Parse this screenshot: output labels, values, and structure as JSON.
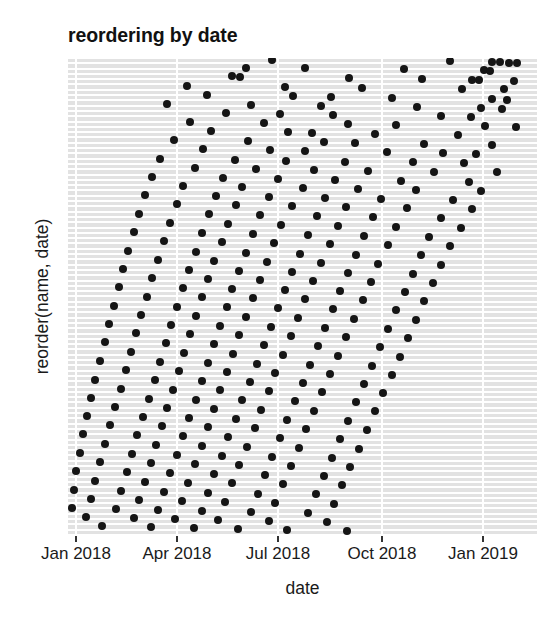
{
  "chart_data": {
    "type": "scatter",
    "title": "reordering by date",
    "xlabel": "date",
    "ylabel": "reorder(name, date)",
    "grid": "horizontal-row-bands-with-vertical-white-gridlines",
    "legend": null,
    "xlim": [
      "2017-12-05",
      "2019-02-20"
    ],
    "x_tick_labels": [
      "Jan 2018",
      "Apr 2018",
      "Jul 2018",
      "Oct 2018",
      "Jan 2019"
    ],
    "x_tick_values": [
      "2018-01-01",
      "2018-04-01",
      "2018-07-01",
      "2018-10-01",
      "2019-01-01"
    ],
    "x_tick_pixels": [
      76,
      177,
      278,
      382,
      483
    ],
    "y_tick_labels": [],
    "y_axis_note": "categorical: names reordered by date; ~90 unlabelled category rows, latest dates at top",
    "n_rows": 90,
    "n_points": 268,
    "point_color": "#151515",
    "point_radius_px": 4,
    "panel_background": "#ffffff",
    "row_band_color": "#e2e2e2",
    "gridline_color": "#ffffff",
    "points_xy_fraction": [
      [
        0.435,
        0.004
      ],
      [
        0.815,
        0.006
      ],
      [
        0.905,
        0.008
      ],
      [
        0.922,
        0.009
      ],
      [
        0.941,
        0.01
      ],
      [
        0.958,
        0.011
      ],
      [
        0.38,
        0.02
      ],
      [
        0.505,
        0.022
      ],
      [
        0.717,
        0.024
      ],
      [
        0.888,
        0.026
      ],
      [
        0.9,
        0.028
      ],
      [
        0.35,
        0.038
      ],
      [
        0.366,
        0.04
      ],
      [
        0.6,
        0.042
      ],
      [
        0.755,
        0.044
      ],
      [
        0.862,
        0.046
      ],
      [
        0.876,
        0.047
      ],
      [
        0.95,
        0.048
      ],
      [
        0.253,
        0.058
      ],
      [
        0.462,
        0.06
      ],
      [
        0.627,
        0.062
      ],
      [
        0.84,
        0.064
      ],
      [
        0.93,
        0.066
      ],
      [
        0.297,
        0.077
      ],
      [
        0.48,
        0.079
      ],
      [
        0.56,
        0.081
      ],
      [
        0.69,
        0.083
      ],
      [
        0.905,
        0.085
      ],
      [
        0.935,
        0.087
      ],
      [
        0.212,
        0.096
      ],
      [
        0.39,
        0.098
      ],
      [
        0.54,
        0.1
      ],
      [
        0.745,
        0.102
      ],
      [
        0.88,
        0.104
      ],
      [
        0.925,
        0.106
      ],
      [
        0.337,
        0.115
      ],
      [
        0.452,
        0.117
      ],
      [
        0.566,
        0.119
      ],
      [
        0.795,
        0.121
      ],
      [
        0.86,
        0.123
      ],
      [
        0.26,
        0.134
      ],
      [
        0.418,
        0.136
      ],
      [
        0.598,
        0.138
      ],
      [
        0.7,
        0.14
      ],
      [
        0.89,
        0.142
      ],
      [
        0.955,
        0.144
      ],
      [
        0.305,
        0.153
      ],
      [
        0.47,
        0.155
      ],
      [
        0.52,
        0.157
      ],
      [
        0.655,
        0.159
      ],
      [
        0.832,
        0.161
      ],
      [
        0.225,
        0.172
      ],
      [
        0.383,
        0.174
      ],
      [
        0.545,
        0.176
      ],
      [
        0.612,
        0.178
      ],
      [
        0.76,
        0.18
      ],
      [
        0.905,
        0.182
      ],
      [
        0.288,
        0.191
      ],
      [
        0.43,
        0.193
      ],
      [
        0.505,
        0.195
      ],
      [
        0.68,
        0.197
      ],
      [
        0.8,
        0.199
      ],
      [
        0.87,
        0.201
      ],
      [
        0.196,
        0.211
      ],
      [
        0.355,
        0.213
      ],
      [
        0.465,
        0.215
      ],
      [
        0.59,
        0.217
      ],
      [
        0.735,
        0.219
      ],
      [
        0.845,
        0.221
      ],
      [
        0.27,
        0.23
      ],
      [
        0.4,
        0.232
      ],
      [
        0.525,
        0.234
      ],
      [
        0.64,
        0.236
      ],
      [
        0.78,
        0.238
      ],
      [
        0.915,
        0.24
      ],
      [
        0.18,
        0.249
      ],
      [
        0.33,
        0.251
      ],
      [
        0.447,
        0.253
      ],
      [
        0.57,
        0.255
      ],
      [
        0.71,
        0.257
      ],
      [
        0.855,
        0.259
      ],
      [
        0.245,
        0.268
      ],
      [
        0.372,
        0.27
      ],
      [
        0.5,
        0.272
      ],
      [
        0.618,
        0.274
      ],
      [
        0.742,
        0.276
      ],
      [
        0.88,
        0.278
      ],
      [
        0.165,
        0.288
      ],
      [
        0.315,
        0.29
      ],
      [
        0.428,
        0.292
      ],
      [
        0.548,
        0.294
      ],
      [
        0.668,
        0.296
      ],
      [
        0.82,
        0.298
      ],
      [
        0.232,
        0.307
      ],
      [
        0.358,
        0.309
      ],
      [
        0.478,
        0.311
      ],
      [
        0.592,
        0.313
      ],
      [
        0.722,
        0.315
      ],
      [
        0.862,
        0.317
      ],
      [
        0.152,
        0.326
      ],
      [
        0.3,
        0.328
      ],
      [
        0.41,
        0.33
      ],
      [
        0.53,
        0.332
      ],
      [
        0.65,
        0.334
      ],
      [
        0.795,
        0.336
      ],
      [
        0.218,
        0.346
      ],
      [
        0.342,
        0.348
      ],
      [
        0.455,
        0.35
      ],
      [
        0.575,
        0.352
      ],
      [
        0.7,
        0.354
      ],
      [
        0.838,
        0.356
      ],
      [
        0.14,
        0.365
      ],
      [
        0.285,
        0.367
      ],
      [
        0.395,
        0.369
      ],
      [
        0.512,
        0.371
      ],
      [
        0.632,
        0.373
      ],
      [
        0.77,
        0.375
      ],
      [
        0.205,
        0.384
      ],
      [
        0.328,
        0.386
      ],
      [
        0.44,
        0.388
      ],
      [
        0.558,
        0.39
      ],
      [
        0.682,
        0.392
      ],
      [
        0.815,
        0.394
      ],
      [
        0.128,
        0.404
      ],
      [
        0.272,
        0.406
      ],
      [
        0.38,
        0.408
      ],
      [
        0.495,
        0.41
      ],
      [
        0.615,
        0.412
      ],
      [
        0.752,
        0.414
      ],
      [
        0.192,
        0.423
      ],
      [
        0.312,
        0.425
      ],
      [
        0.425,
        0.427
      ],
      [
        0.54,
        0.429
      ],
      [
        0.662,
        0.431
      ],
      [
        0.795,
        0.433
      ],
      [
        0.118,
        0.442
      ],
      [
        0.258,
        0.444
      ],
      [
        0.365,
        0.446
      ],
      [
        0.478,
        0.448
      ],
      [
        0.598,
        0.45
      ],
      [
        0.735,
        0.452
      ],
      [
        0.18,
        0.461
      ],
      [
        0.298,
        0.463
      ],
      [
        0.41,
        0.465
      ],
      [
        0.522,
        0.467
      ],
      [
        0.645,
        0.469
      ],
      [
        0.778,
        0.471
      ],
      [
        0.108,
        0.481
      ],
      [
        0.245,
        0.483
      ],
      [
        0.35,
        0.485
      ],
      [
        0.462,
        0.487
      ],
      [
        0.58,
        0.489
      ],
      [
        0.718,
        0.491
      ],
      [
        0.168,
        0.5
      ],
      [
        0.285,
        0.502
      ],
      [
        0.395,
        0.504
      ],
      [
        0.505,
        0.506
      ],
      [
        0.628,
        0.508
      ],
      [
        0.76,
        0.51
      ],
      [
        0.098,
        0.519
      ],
      [
        0.232,
        0.521
      ],
      [
        0.338,
        0.523
      ],
      [
        0.448,
        0.525
      ],
      [
        0.565,
        0.527
      ],
      [
        0.7,
        0.529
      ],
      [
        0.156,
        0.539
      ],
      [
        0.272,
        0.541
      ],
      [
        0.38,
        0.543
      ],
      [
        0.49,
        0.545
      ],
      [
        0.61,
        0.547
      ],
      [
        0.742,
        0.549
      ],
      [
        0.088,
        0.558
      ],
      [
        0.22,
        0.56
      ],
      [
        0.325,
        0.562
      ],
      [
        0.432,
        0.564
      ],
      [
        0.548,
        0.566
      ],
      [
        0.682,
        0.568
      ],
      [
        0.145,
        0.577
      ],
      [
        0.26,
        0.579
      ],
      [
        0.365,
        0.581
      ],
      [
        0.475,
        0.583
      ],
      [
        0.592,
        0.585
      ],
      [
        0.725,
        0.587
      ],
      [
        0.078,
        0.596
      ],
      [
        0.208,
        0.598
      ],
      [
        0.312,
        0.6
      ],
      [
        0.418,
        0.602
      ],
      [
        0.532,
        0.604
      ],
      [
        0.665,
        0.606
      ],
      [
        0.135,
        0.616
      ],
      [
        0.248,
        0.618
      ],
      [
        0.352,
        0.62
      ],
      [
        0.458,
        0.622
      ],
      [
        0.575,
        0.624
      ],
      [
        0.708,
        0.626
      ],
      [
        0.068,
        0.635
      ],
      [
        0.196,
        0.637
      ],
      [
        0.298,
        0.639
      ],
      [
        0.402,
        0.641
      ],
      [
        0.515,
        0.643
      ],
      [
        0.648,
        0.645
      ],
      [
        0.124,
        0.654
      ],
      [
        0.236,
        0.656
      ],
      [
        0.338,
        0.658
      ],
      [
        0.442,
        0.66
      ],
      [
        0.558,
        0.662
      ],
      [
        0.69,
        0.664
      ],
      [
        0.058,
        0.674
      ],
      [
        0.185,
        0.676
      ],
      [
        0.285,
        0.678
      ],
      [
        0.388,
        0.68
      ],
      [
        0.5,
        0.682
      ],
      [
        0.632,
        0.684
      ],
      [
        0.112,
        0.693
      ],
      [
        0.224,
        0.695
      ],
      [
        0.325,
        0.697
      ],
      [
        0.428,
        0.699
      ],
      [
        0.542,
        0.701
      ],
      [
        0.672,
        0.703
      ],
      [
        0.048,
        0.712
      ],
      [
        0.172,
        0.714
      ],
      [
        0.272,
        0.716
      ],
      [
        0.372,
        0.718
      ],
      [
        0.485,
        0.72
      ],
      [
        0.615,
        0.722
      ],
      [
        0.1,
        0.731
      ],
      [
        0.212,
        0.733
      ],
      [
        0.312,
        0.735
      ],
      [
        0.412,
        0.737
      ],
      [
        0.525,
        0.739
      ],
      [
        0.655,
        0.741
      ],
      [
        0.04,
        0.751
      ],
      [
        0.16,
        0.753
      ],
      [
        0.258,
        0.755
      ],
      [
        0.358,
        0.757
      ],
      [
        0.468,
        0.759
      ],
      [
        0.598,
        0.761
      ],
      [
        0.09,
        0.77
      ],
      [
        0.2,
        0.772
      ],
      [
        0.298,
        0.774
      ],
      [
        0.398,
        0.776
      ],
      [
        0.508,
        0.778
      ],
      [
        0.638,
        0.78
      ],
      [
        0.032,
        0.789
      ],
      [
        0.148,
        0.791
      ],
      [
        0.245,
        0.793
      ],
      [
        0.342,
        0.795
      ],
      [
        0.452,
        0.797
      ],
      [
        0.58,
        0.799
      ],
      [
        0.078,
        0.809
      ],
      [
        0.188,
        0.811
      ],
      [
        0.285,
        0.813
      ],
      [
        0.382,
        0.815
      ],
      [
        0.492,
        0.817
      ],
      [
        0.62,
        0.819
      ],
      [
        0.025,
        0.828
      ],
      [
        0.136,
        0.83
      ],
      [
        0.232,
        0.832
      ],
      [
        0.328,
        0.834
      ],
      [
        0.435,
        0.836
      ],
      [
        0.562,
        0.838
      ],
      [
        0.068,
        0.847
      ],
      [
        0.176,
        0.849
      ],
      [
        0.27,
        0.851
      ],
      [
        0.365,
        0.853
      ],
      [
        0.475,
        0.855
      ],
      [
        0.602,
        0.857
      ],
      [
        0.018,
        0.866
      ],
      [
        0.125,
        0.868
      ],
      [
        0.218,
        0.87
      ],
      [
        0.312,
        0.872
      ],
      [
        0.42,
        0.874
      ],
      [
        0.545,
        0.876
      ],
      [
        0.058,
        0.886
      ],
      [
        0.164,
        0.888
      ],
      [
        0.255,
        0.89
      ],
      [
        0.35,
        0.892
      ],
      [
        0.458,
        0.894
      ],
      [
        0.585,
        0.896
      ],
      [
        0.012,
        0.905
      ],
      [
        0.112,
        0.907
      ],
      [
        0.205,
        0.909
      ],
      [
        0.298,
        0.911
      ],
      [
        0.405,
        0.913
      ],
      [
        0.528,
        0.915
      ],
      [
        0.048,
        0.924
      ],
      [
        0.152,
        0.926
      ],
      [
        0.242,
        0.928
      ],
      [
        0.335,
        0.93
      ],
      [
        0.442,
        0.932
      ],
      [
        0.568,
        0.934
      ],
      [
        0.008,
        0.944
      ],
      [
        0.102,
        0.946
      ],
      [
        0.192,
        0.948
      ],
      [
        0.285,
        0.95
      ],
      [
        0.39,
        0.952
      ],
      [
        0.512,
        0.954
      ],
      [
        0.038,
        0.963
      ],
      [
        0.14,
        0.965
      ],
      [
        0.228,
        0.967
      ],
      [
        0.32,
        0.969
      ],
      [
        0.428,
        0.971
      ],
      [
        0.552,
        0.973
      ],
      [
        0.072,
        0.982
      ],
      [
        0.178,
        0.984
      ],
      [
        0.268,
        0.986
      ],
      [
        0.362,
        0.988
      ],
      [
        0.468,
        0.99
      ],
      [
        0.595,
        0.992
      ]
    ]
  },
  "chart": {
    "title": "reordering by date",
    "x_axis_title": "date",
    "y_axis_title": "reorder(name, date)"
  }
}
